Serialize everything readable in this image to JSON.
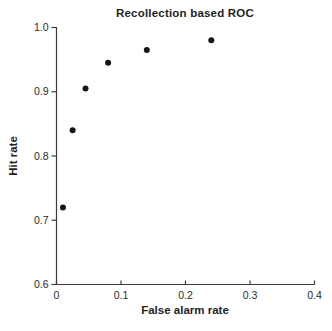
{
  "figure": {
    "title": "Recollection based ROC",
    "x_axis_label": "False alarm rate",
    "y_axis_label": "Hit rate"
  },
  "chart_data": {
    "type": "scatter",
    "title": "Recollection based ROC",
    "xlabel": "False alarm rate",
    "ylabel": "Hit rate",
    "xlim": [
      0,
      0.4
    ],
    "ylim": [
      0.6,
      1.0
    ],
    "x_ticks": [
      0,
      0.1,
      0.2,
      0.3,
      0.4
    ],
    "x_tick_labels": [
      "0",
      "0.1",
      "0.2",
      "0.3",
      "0.4"
    ],
    "y_ticks": [
      1.0,
      0.9,
      0.8,
      0.7,
      0.6
    ],
    "y_tick_labels": [
      "1.0",
      "0.9",
      "0.8",
      "0.7",
      "0.6"
    ],
    "grid": false,
    "legend": "none",
    "marker": {
      "shape": "filled-circle",
      "color": "#161616",
      "radius_px": 3
    },
    "series": [
      {
        "name": "recollection-roc-points",
        "points": [
          {
            "x": 0.01,
            "y": 0.72
          },
          {
            "x": 0.025,
            "y": 0.84
          },
          {
            "x": 0.045,
            "y": 0.905
          },
          {
            "x": 0.08,
            "y": 0.945
          },
          {
            "x": 0.14,
            "y": 0.965
          },
          {
            "x": 0.24,
            "y": 0.98
          }
        ]
      }
    ],
    "colors": {
      "axis": "#3c3c3c",
      "tick_text": "#2b2b2b",
      "title_text": "#1f1f1f",
      "background": "#ffffff"
    }
  }
}
